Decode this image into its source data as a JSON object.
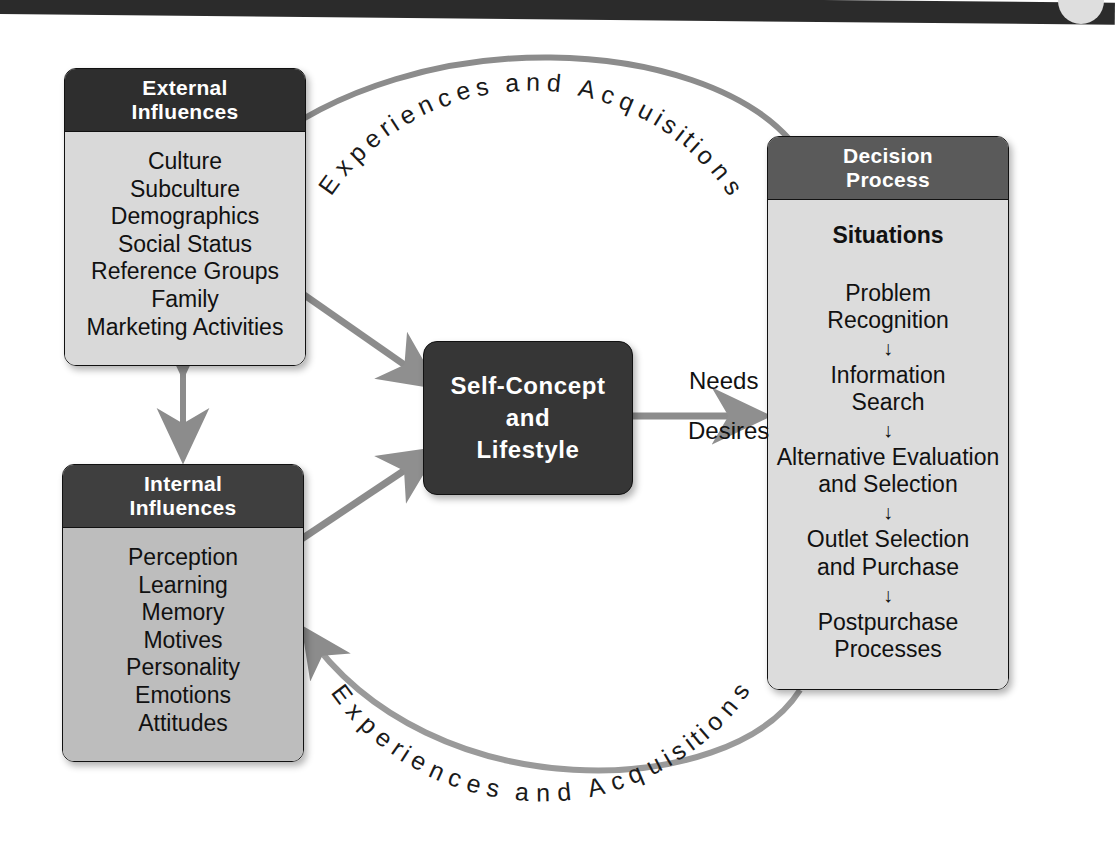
{
  "page": {
    "top_bar_color": "#2b2b2b"
  },
  "colors": {
    "header_dark": "#2e2e2e",
    "header_mid": "#3f3f3f",
    "header_light": "#5a5a5a",
    "body_light_gray": "#d9d9d9",
    "body_mid_gray": "#bdbdbd",
    "body_decision_gray": "#dcdcdc",
    "center_box": "#363636",
    "arrow_gray": "#8c8c8c",
    "text_dark": "#111111",
    "text_light": "#ffffff"
  },
  "external": {
    "title_line1": "External",
    "title_line2": "Influences",
    "items": [
      "Culture",
      "Subculture",
      "Demographics",
      "Social Status",
      "Reference Groups",
      "Family",
      "Marketing Activities"
    ]
  },
  "internal": {
    "title_line1": "Internal",
    "title_line2": "Influences",
    "items": [
      "Perception",
      "Learning",
      "Memory",
      "Motives",
      "Personality",
      "Emotions",
      "Attitudes"
    ]
  },
  "self_concept": {
    "line1": "Self-Concept",
    "line2": "and",
    "line3": "Lifestyle"
  },
  "decision": {
    "title_line1": "Decision",
    "title_line2": "Process",
    "subtitle": "Situations",
    "steps": [
      {
        "line1": "Problem",
        "line2": "Recognition"
      },
      {
        "line1": "Information",
        "line2": "Search"
      },
      {
        "line1": "Alternative Evaluation",
        "line2": "and Selection"
      },
      {
        "line1": "Outlet Selection",
        "line2": "and Purchase"
      },
      {
        "line1": "Postpurchase",
        "line2": "Processes"
      }
    ],
    "step_arrow_glyph": "↓"
  },
  "flow_labels": {
    "needs": "Needs",
    "desires": "Desires",
    "feedback_top": "Experiences and Acquisitions",
    "feedback_bottom": "Experiences and Acquisitions"
  }
}
